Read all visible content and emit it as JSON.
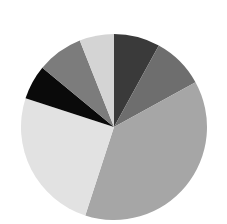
{
  "chart_data": {
    "type": "pie",
    "title": "",
    "legend": [],
    "start_angle_deg": 0,
    "direction": "clockwise",
    "slices": [
      {
        "label": "",
        "value": 8,
        "color": "#3a3a3a"
      },
      {
        "label": "",
        "value": 9,
        "color": "#6e6e6e"
      },
      {
        "label": "",
        "value": 38,
        "color": "#a6a6a6"
      },
      {
        "label": "",
        "value": 25,
        "color": "#e2e2e2"
      },
      {
        "label": "",
        "value": 6,
        "color": "#0a0a0a"
      },
      {
        "label": "",
        "value": 8,
        "color": "#7c7c7c"
      },
      {
        "label": "",
        "value": 6,
        "color": "#d4d4d4"
      }
    ],
    "values": [
      8,
      9,
      38,
      25,
      6,
      8,
      6
    ],
    "grid": false,
    "legend_position": "none"
  },
  "layout": {
    "center_x": 114,
    "center_y": 127,
    "radius": 93,
    "background": "#ffffff"
  }
}
